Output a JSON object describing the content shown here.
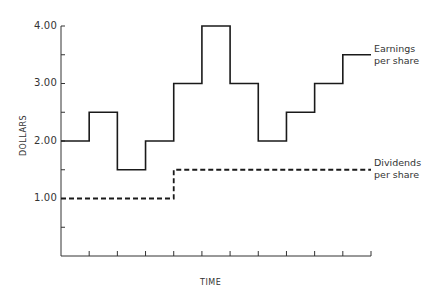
{
  "chart_data": {
    "type": "line",
    "style": "step",
    "title": "",
    "xlabel": "TIME",
    "ylabel": "DOLLARS",
    "ylim": [
      0,
      4.0
    ],
    "yticks": [
      0.5,
      1.0,
      1.5,
      2.0,
      2.5,
      3.0,
      3.5,
      4.0
    ],
    "ytick_labels": [
      "",
      "1.00",
      "",
      "2.00",
      "",
      "3.00",
      "",
      "4.00"
    ],
    "x_periods": 11,
    "x_tick_labels": [],
    "grid": false,
    "legend": "inline labels at right end of each series",
    "x": [
      1,
      2,
      3,
      4,
      5,
      6,
      7,
      8,
      9,
      10,
      11
    ],
    "series": [
      {
        "name": "Earnings per share",
        "style": "solid",
        "values": [
          2.0,
          2.5,
          1.5,
          2.0,
          3.0,
          4.0,
          3.0,
          2.0,
          2.5,
          3.0,
          3.5
        ]
      },
      {
        "name": "Dividends per share",
        "style": "dashed",
        "values": [
          1.0,
          1.0,
          1.0,
          1.0,
          1.5,
          1.5,
          1.5,
          1.5,
          1.5,
          1.5,
          1.5
        ]
      }
    ]
  },
  "labels": {
    "y_axis": "DOLLARS",
    "x_axis": "TIME",
    "y_ticks": {
      "t4": "4.00",
      "t3": "3.00",
      "t2": "2.00",
      "t1": "1.00"
    },
    "earnings": {
      "line1": "Earnings",
      "line2": "per share"
    },
    "dividends": {
      "line1": "Dividends",
      "line2": "per share"
    }
  }
}
